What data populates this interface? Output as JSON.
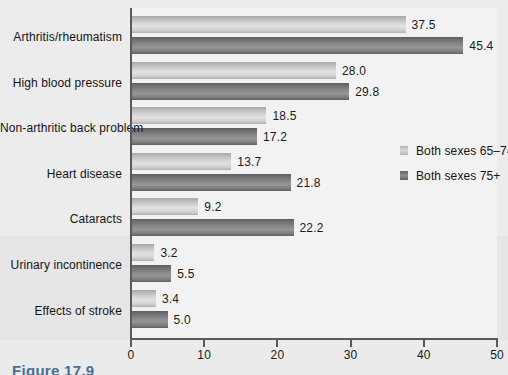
{
  "caption": "Figure 17.9",
  "legend": {
    "position": "right",
    "items": [
      {
        "label": "Both sexes 65–74",
        "swatch": "light-gray-gradient",
        "color": "#c8c8c8"
      },
      {
        "label": "Both sexes 75+",
        "swatch": "dark-gray-gradient",
        "color": "#7d7d7d"
      }
    ]
  },
  "axis": {
    "x_ticks": [
      "0",
      "10",
      "20",
      "30",
      "40",
      "50"
    ]
  },
  "chart_data": {
    "type": "bar",
    "orientation": "horizontal",
    "title": "",
    "xlabel": "",
    "ylabel": "",
    "xlim": [
      0,
      50
    ],
    "xticks": [
      0,
      10,
      20,
      30,
      40,
      50
    ],
    "grid": false,
    "legend_position": "right",
    "categories": [
      "Arthritis/rheumatism",
      "High blood pressure",
      "Non-arthritic back problem",
      "Heart disease",
      "Cataracts",
      "Urinary incontinence",
      "Effects of stroke"
    ],
    "series": [
      {
        "name": "Both sexes 65–74",
        "color": "#c8c8c8",
        "values": [
          37.5,
          28.0,
          18.5,
          13.7,
          9.2,
          3.2,
          3.4
        ],
        "labels": [
          "37.5",
          "28.0",
          "18.5",
          "13.7",
          "9.2",
          "3.2",
          "3.4"
        ]
      },
      {
        "name": "Both sexes 75+",
        "color": "#7d7d7d",
        "values": [
          45.4,
          29.8,
          17.2,
          21.8,
          22.2,
          5.5,
          5.0
        ],
        "labels": [
          "45.4",
          "29.8",
          "17.2",
          "21.8",
          "22.2",
          "5.5",
          "5.0"
        ]
      }
    ]
  }
}
